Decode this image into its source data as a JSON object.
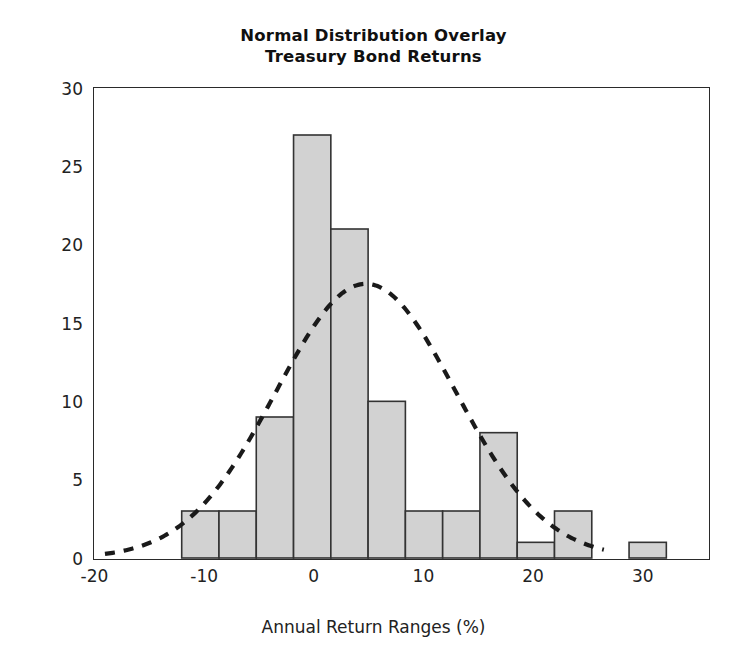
{
  "chart_data": {
    "type": "bar",
    "title": "Normal Distribution Overlay",
    "subtitle": "Treasury Bond Returns",
    "xlabel": "Annual Return Ranges (%)",
    "ylabel": "Count",
    "xlim": [
      -20,
      36
    ],
    "ylim": [
      0,
      30
    ],
    "grid": false,
    "legend": "none",
    "xticks": [
      -20,
      -10,
      0,
      10,
      20,
      30
    ],
    "xtick_labels": [
      "-20",
      "-10",
      "0",
      "10",
      "20",
      "30"
    ],
    "yticks": [
      0,
      5,
      10,
      15,
      20,
      25,
      30
    ],
    "ytick_labels": [
      "0",
      "5",
      "10",
      "15",
      "20",
      "25",
      "30"
    ],
    "bin_edges": [
      -12.0,
      -8.6,
      -5.2,
      -1.8,
      1.6,
      5.0,
      8.4,
      11.8,
      15.2,
      18.6,
      22.0,
      25.4,
      28.8,
      32.2
    ],
    "categories": [
      "-12 to -8.6",
      "-8.6 to -5.2",
      "-5.2 to -1.8",
      "-1.8 to 1.6",
      "1.6 to 5.0",
      "5.0 to 8.4",
      "8.4 to 11.8",
      "11.8 to 15.2",
      "15.2 to 18.6",
      "18.6 to 22.0",
      "22.0 to 25.4",
      "25.4 to 28.8",
      "28.8 to 32.2"
    ],
    "values": [
      3,
      3,
      9,
      27,
      21,
      10,
      3,
      3,
      8,
      1,
      3,
      0,
      1
    ],
    "bar_fill_color": "#d2d2d2",
    "bar_edge_color": "#333333",
    "overlay": {
      "name": "normal-distribution-curve",
      "style": "dashed",
      "color": "#1a1a1a",
      "mean": 4.8,
      "peak_count": 17.5,
      "std_dev": 8.2,
      "x_start": -19.0,
      "x_end": 26.5
    },
    "annotations": []
  },
  "axis": {
    "y_title": "Count",
    "x_title": "Annual Return Ranges (%)"
  }
}
